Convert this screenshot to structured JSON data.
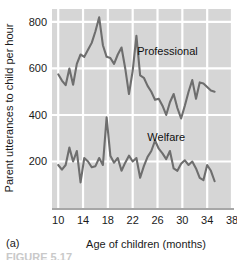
{
  "figure": {
    "panel_label": "(a)",
    "caption_partial": "FIGURE 5.17"
  },
  "chart_data": {
    "type": "line",
    "title": "",
    "xlabel": "Age of children (months)",
    "ylabel": "Parent utterances to child per hour",
    "xlim": [
      9,
      38
    ],
    "ylim": [
      0,
      860
    ],
    "xticks": [
      10,
      14,
      18,
      22,
      26,
      30,
      34,
      38
    ],
    "xticklabels": [
      "10",
      "14",
      "18",
      "22",
      "26",
      "30",
      "34",
      "38"
    ],
    "yticks": [
      200,
      400,
      600,
      800
    ],
    "yticklabels": [
      "200",
      "400",
      "600",
      "800"
    ],
    "grid": "both-white-on-gray",
    "plot_background": "#d6d6d6",
    "gridline_color": "#ffffff",
    "line_color": "#6e6e6e",
    "legend_position": "inline-annotations",
    "series": [
      {
        "name": "Professional",
        "annotation": "Professional",
        "annotation_x": 27.6,
        "annotation_y": 660,
        "x": [
          10,
          10.6,
          11.2,
          11.8,
          12.4,
          13,
          13.6,
          14.2,
          14.8,
          15.4,
          16,
          16.6,
          17.2,
          17.8,
          18.4,
          19,
          19.6,
          20.2,
          20.8,
          21.4,
          22,
          22.6,
          23.2,
          23.8,
          24.4,
          25,
          25.6,
          26.2,
          26.8,
          27.4,
          28,
          28.6,
          29.2,
          29.8,
          30.4,
          31,
          31.6,
          32.2,
          32.8,
          33.4,
          34,
          34.6,
          35.2
        ],
        "values": [
          575,
          548,
          528,
          600,
          530,
          620,
          660,
          650,
          680,
          710,
          760,
          820,
          700,
          650,
          645,
          620,
          660,
          690,
          600,
          490,
          590,
          740,
          570,
          560,
          525,
          500,
          465,
          470,
          440,
          400,
          455,
          490,
          430,
          385,
          440,
          500,
          550,
          470,
          540,
          535,
          520,
          505,
          500
        ]
      },
      {
        "name": "Welfare",
        "annotation": "Welfare",
        "annotation_x": 27.4,
        "annotation_y": 290,
        "x": [
          10,
          10.6,
          11.2,
          11.8,
          12.4,
          13,
          13.6,
          14.2,
          14.8,
          15.4,
          16,
          16.6,
          17.2,
          17.8,
          18.4,
          19,
          19.6,
          20.2,
          20.8,
          21.4,
          22,
          22.6,
          23.2,
          23.8,
          24.4,
          25,
          25.6,
          26.2,
          26.8,
          27.4,
          28,
          28.6,
          29.2,
          29.8,
          30.4,
          31,
          31.6,
          32.2,
          32.8,
          33.4,
          34,
          34.6,
          35.2
        ],
        "values": [
          185,
          165,
          185,
          260,
          200,
          245,
          110,
          215,
          200,
          175,
          180,
          215,
          185,
          390,
          225,
          195,
          215,
          160,
          195,
          225,
          200,
          215,
          130,
          180,
          220,
          245,
          290,
          255,
          235,
          210,
          245,
          170,
          160,
          190,
          205,
          185,
          200,
          170,
          130,
          120,
          185,
          160,
          115
        ]
      }
    ]
  }
}
